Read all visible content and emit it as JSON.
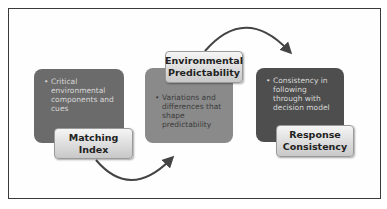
{
  "diagram": {
    "blocks": [
      {
        "title": "Matching\nIndex",
        "bullet": "Critical environmental components and cues",
        "color": "#6b6b6b"
      },
      {
        "title": "Environmental\nPredictability",
        "bullet": "Variations and differences that shape predictability",
        "color": "#8a8a8a"
      },
      {
        "title": "Response\nConsistency",
        "bullet": "Consistency in following through with decision model",
        "color": "#4e4e4e"
      }
    ],
    "bullet_symbol": "•",
    "arrows": [
      {
        "from": "Matching Index",
        "to": "Environmental Predictability"
      },
      {
        "from": "Environmental Predictability",
        "to": "Response Consistency"
      }
    ]
  }
}
